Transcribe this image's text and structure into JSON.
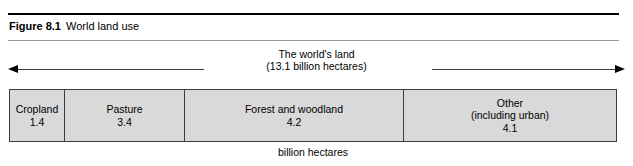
{
  "figure": {
    "label": "Figure 8.1",
    "title": "World land use"
  },
  "span": {
    "heading_line1": "The world's land",
    "heading_line2": "(13.1 billion hectares)",
    "arrow_left": "arrow-left-icon",
    "arrow_right": "arrow-right-icon"
  },
  "chart_data": {
    "type": "bar",
    "orientation": "horizontal-stacked",
    "title": "World land use",
    "xlabel": "billion hectares",
    "ylabel": "",
    "total": 13.1,
    "total_label": "(13.1 billion hectares)",
    "unit": "billion hectares",
    "grid": false,
    "legend": "none",
    "categories": [
      "Cropland",
      "Pasture",
      "Forest and woodland",
      "Other (including urban)"
    ],
    "values": [
      1.4,
      3.4,
      4.2,
      4.1
    ],
    "segments": [
      {
        "name": "Cropland",
        "line1": "Cropland",
        "line2": "",
        "value": "1.4",
        "numeric": 1.4
      },
      {
        "name": "Pasture",
        "line1": "Pasture",
        "line2": "",
        "value": "3.4",
        "numeric": 3.4
      },
      {
        "name": "Forest and woodland",
        "line1": "Forest and woodland",
        "line2": "",
        "value": "4.2",
        "numeric": 4.2
      },
      {
        "name": "Other",
        "line1": "Other",
        "line2": "(including urban)",
        "value": "4.1",
        "numeric": 4.1
      }
    ],
    "colors": {
      "segment_fill": "#d9d9d9",
      "segment_border": "#3d3d3d",
      "rule_thick": "#000000",
      "rule_thin": "#9a9a9a",
      "text": "#000000"
    }
  },
  "unit_caption": "billion hectares"
}
